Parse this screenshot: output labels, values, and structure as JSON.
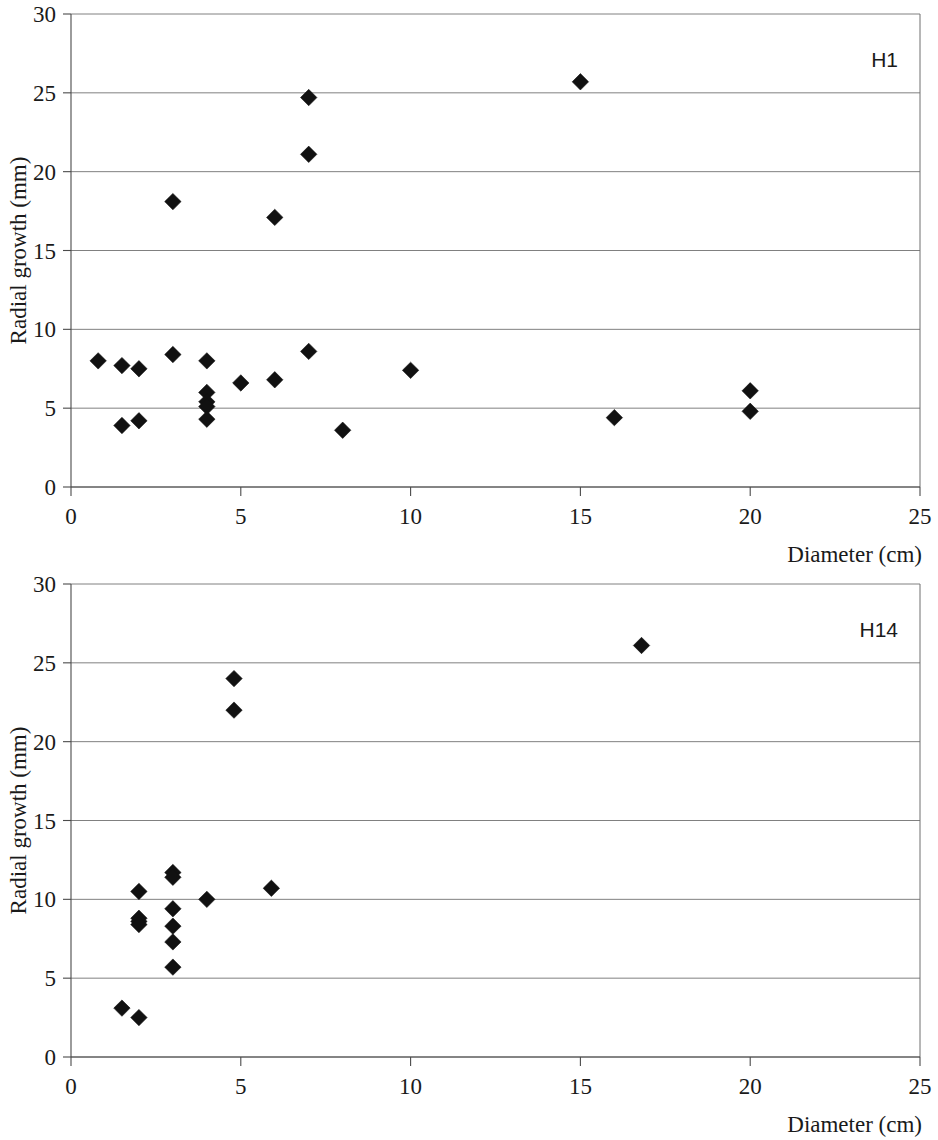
{
  "figure": {
    "panel_count": 2,
    "marker_symbol": "filled-diamond",
    "marker_color": "#111111",
    "grid_color": "#808080",
    "axis_color": "#4a4a4a"
  },
  "chart_data": [
    {
      "type": "scatter",
      "title": "",
      "series_label": "H1",
      "xlabel": "Diameter (cm)",
      "ylabel": "Radial growth (mm)",
      "xlim": [
        0,
        25
      ],
      "ylim": [
        0,
        30
      ],
      "xticks": [
        0,
        5,
        10,
        15,
        20,
        25
      ],
      "yticks": [
        0,
        5,
        10,
        15,
        20,
        25,
        30
      ],
      "xtick_labels": [
        "0",
        "5",
        "10",
        "15",
        "20",
        "25"
      ],
      "ytick_labels": [
        "0",
        "5",
        "10",
        "15",
        "20",
        "25",
        "30"
      ],
      "grid": "horizontal",
      "legend": "none",
      "points": [
        {
          "x": 0.8,
          "y": 8.0
        },
        {
          "x": 1.5,
          "y": 7.7
        },
        {
          "x": 1.5,
          "y": 3.9
        },
        {
          "x": 2.0,
          "y": 7.5
        },
        {
          "x": 2.0,
          "y": 4.2
        },
        {
          "x": 3.0,
          "y": 18.1
        },
        {
          "x": 3.0,
          "y": 8.4
        },
        {
          "x": 4.0,
          "y": 8.0
        },
        {
          "x": 4.0,
          "y": 6.0
        },
        {
          "x": 4.0,
          "y": 5.4
        },
        {
          "x": 4.0,
          "y": 5.1
        },
        {
          "x": 4.0,
          "y": 4.3
        },
        {
          "x": 5.0,
          "y": 6.6
        },
        {
          "x": 6.0,
          "y": 17.1
        },
        {
          "x": 6.0,
          "y": 6.8
        },
        {
          "x": 7.0,
          "y": 24.7
        },
        {
          "x": 7.0,
          "y": 21.1
        },
        {
          "x": 7.0,
          "y": 8.6
        },
        {
          "x": 8.0,
          "y": 3.6
        },
        {
          "x": 10.0,
          "y": 7.4
        },
        {
          "x": 15.0,
          "y": 25.7
        },
        {
          "x": 16.0,
          "y": 4.4
        },
        {
          "x": 20.0,
          "y": 6.1
        },
        {
          "x": 20.0,
          "y": 4.8
        }
      ]
    },
    {
      "type": "scatter",
      "title": "",
      "series_label": "H14",
      "xlabel": "Diameter (cm)",
      "ylabel": "Radial growth (mm)",
      "xlim": [
        0,
        25
      ],
      "ylim": [
        0,
        30
      ],
      "xticks": [
        0,
        5,
        10,
        15,
        20,
        25
      ],
      "yticks": [
        0,
        5,
        10,
        15,
        20,
        25,
        30
      ],
      "xtick_labels": [
        "0",
        "5",
        "10",
        "15",
        "20",
        "25"
      ],
      "ytick_labels": [
        "0",
        "5",
        "10",
        "15",
        "20",
        "25",
        "30"
      ],
      "grid": "horizontal",
      "legend": "none",
      "points": [
        {
          "x": 1.5,
          "y": 3.1
        },
        {
          "x": 2.0,
          "y": 2.5
        },
        {
          "x": 2.0,
          "y": 10.5
        },
        {
          "x": 2.0,
          "y": 8.8
        },
        {
          "x": 2.0,
          "y": 8.6
        },
        {
          "x": 2.0,
          "y": 8.4
        },
        {
          "x": 3.0,
          "y": 11.7
        },
        {
          "x": 3.0,
          "y": 11.4
        },
        {
          "x": 3.0,
          "y": 9.4
        },
        {
          "x": 3.0,
          "y": 8.3
        },
        {
          "x": 3.0,
          "y": 7.3
        },
        {
          "x": 3.0,
          "y": 5.7
        },
        {
          "x": 4.0,
          "y": 10.0
        },
        {
          "x": 4.8,
          "y": 24.0
        },
        {
          "x": 4.8,
          "y": 22.0
        },
        {
          "x": 5.9,
          "y": 10.7
        },
        {
          "x": 16.8,
          "y": 26.1
        }
      ]
    }
  ]
}
